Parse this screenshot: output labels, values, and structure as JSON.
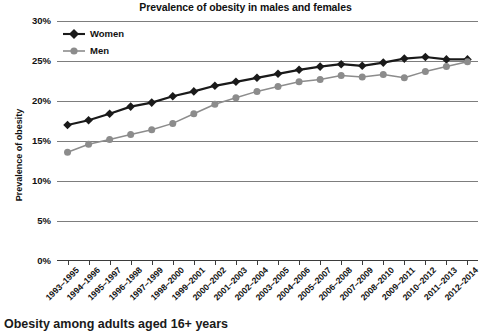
{
  "chart_data": {
    "type": "line",
    "title": "Prevalence of obesity in males and females",
    "xlabel": "",
    "ylabel": "Prevalence of obesity",
    "ylim": [
      0,
      30
    ],
    "yticks": [
      "0%",
      "5%",
      "10%",
      "15%",
      "20%",
      "25%",
      "30%"
    ],
    "ytick_values": [
      0,
      5,
      10,
      15,
      20,
      25,
      30
    ],
    "grid": true,
    "legend_position": "top-left",
    "categories": [
      "1993–1995",
      "1994–1996",
      "1995–1997",
      "1996–1998",
      "1997–1999",
      "1998–2000",
      "1999–2001",
      "2000–2002",
      "2001–2003",
      "2002–2004",
      "2003–2005",
      "2004–2006",
      "2005–2007",
      "2006–2008",
      "2007–2009",
      "2008–2010",
      "2009–2011",
      "2010–2012",
      "2011–2013",
      "2012–2014"
    ],
    "series": [
      {
        "name": "Women",
        "color": "#1a1a1a",
        "marker": "diamond",
        "values": [
          17.0,
          17.6,
          18.4,
          19.3,
          19.8,
          20.6,
          21.2,
          21.9,
          22.4,
          22.9,
          23.4,
          23.9,
          24.3,
          24.6,
          24.4,
          24.8,
          25.3,
          25.5,
          25.2,
          25.2
        ]
      },
      {
        "name": "Men",
        "color": "#8c8c8c",
        "marker": "circle",
        "values": [
          13.6,
          14.6,
          15.2,
          15.8,
          16.4,
          17.2,
          18.4,
          19.6,
          20.4,
          21.2,
          21.8,
          22.4,
          22.7,
          23.2,
          23.0,
          23.3,
          22.9,
          23.7,
          24.3,
          24.9
        ]
      }
    ]
  },
  "caption": "Obesity among adults aged 16+ years"
}
